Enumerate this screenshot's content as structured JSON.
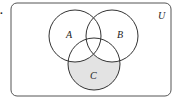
{
  "problem_label": ".",
  "universe_label": "U",
  "sets": [
    {
      "name": "A",
      "cx": 75,
      "cy": 36,
      "r": 26
    },
    {
      "name": "B",
      "cx": 112,
      "cy": 36,
      "r": 26
    },
    {
      "name": "C",
      "cx": 94,
      "cy": 64,
      "r": 26
    }
  ],
  "shaded_region": "C minus (A union B)",
  "colors": {
    "shade": "#e3e3e3",
    "stroke": "#333333",
    "frame": "#555555"
  }
}
